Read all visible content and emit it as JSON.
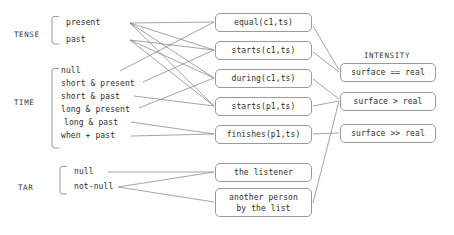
{
  "diagram": {
    "type": "feature-to-predicate mapping diagram",
    "groups": [
      {
        "name": "tense-group",
        "label": "TENSE",
        "label_x": 14,
        "label_y": 30,
        "bracket": {
          "x": 52,
          "y": 16,
          "width": 7,
          "height": 28
        },
        "items": [
          {
            "label": "present",
            "x": 66,
            "y": 18,
            "anchor_x": 128,
            "anchor_y": 23
          },
          {
            "label": "past",
            "x": 66,
            "y": 35,
            "anchor_x": 128,
            "anchor_y": 40
          }
        ]
      },
      {
        "name": "time-group",
        "label": "TIME",
        "label_x": 14,
        "label_y": 98,
        "bracket": {
          "x": 52,
          "y": 68,
          "width": 7,
          "height": 80
        },
        "items": [
          {
            "label": "null",
            "x": 61,
            "y": 66,
            "anchor_x": 120,
            "anchor_y": 71
          },
          {
            "label": "short & present",
            "x": 61,
            "y": 79,
            "anchor_x": 142,
            "anchor_y": 84
          },
          {
            "label": "short & past",
            "x": 61,
            "y": 92,
            "anchor_x": 133,
            "anchor_y": 97
          },
          {
            "label": "long & present",
            "x": 61,
            "y": 105,
            "anchor_x": 138,
            "anchor_y": 110
          },
          {
            "label": "long & past",
            "x": 64,
            "y": 118,
            "anchor_x": 130,
            "anchor_y": 123
          },
          {
            "label": "when + past",
            "x": 61,
            "y": 131,
            "anchor_x": 130,
            "anchor_y": 136
          }
        ]
      },
      {
        "name": "tar-group",
        "label": "TAR",
        "label_x": 18,
        "label_y": 183,
        "bracket": {
          "x": 60,
          "y": 166,
          "width": 7,
          "height": 28
        },
        "items": [
          {
            "label": "null",
            "x": 74,
            "y": 167,
            "anchor_x": 108,
            "anchor_y": 172
          },
          {
            "label": "not-null",
            "x": 74,
            "y": 182,
            "anchor_x": 117,
            "anchor_y": 187
          }
        ]
      }
    ],
    "predicate_nodes": [
      {
        "name": "equal-c1-ts",
        "label": "equal(c1,ts)",
        "x": 215,
        "y": 13,
        "width": 97,
        "height": 19
      },
      {
        "name": "starts-c1-ts",
        "label": "starts(c1,ts)",
        "x": 215,
        "y": 41,
        "width": 97,
        "height": 19
      },
      {
        "name": "during-c1-ts",
        "label": "during(c1,ts)",
        "x": 215,
        "y": 69,
        "width": 97,
        "height": 19
      },
      {
        "name": "starts-p1-ts",
        "label": "starts(p1,ts)",
        "x": 215,
        "y": 97,
        "width": 97,
        "height": 19
      },
      {
        "name": "finishes-p1-ts",
        "label": "finishes(p1,ts)",
        "x": 215,
        "y": 125,
        "width": 97,
        "height": 19
      }
    ],
    "target_nodes": [
      {
        "name": "the-listener",
        "label": "the listener",
        "x": 215,
        "y": 163,
        "width": 97,
        "height": 19
      },
      {
        "name": "another-person-by-the-list",
        "label": "another person\nby the list",
        "x": 215,
        "y": 188,
        "width": 97,
        "height": 29
      }
    ],
    "intensity_column": {
      "heading": "INTENSITY",
      "heading_x": 364,
      "heading_y": 51,
      "nodes": [
        {
          "name": "surface-equals-real",
          "label": "surface == real",
          "x": 340,
          "y": 63,
          "width": 96,
          "height": 19
        },
        {
          "name": "surface-greater-real",
          "label": "surface > real",
          "x": 340,
          "y": 92,
          "width": 96,
          "height": 19
        },
        {
          "name": "surface-much-greater-real",
          "label": "surface >> real",
          "x": 340,
          "y": 124,
          "width": 96,
          "height": 19
        }
      ]
    },
    "edges": [
      {
        "from": "present",
        "to": "equal-c1-ts",
        "x1": 130,
        "y1": 23,
        "x2": 214,
        "y2": 22
      },
      {
        "from": "present",
        "to": "during-c1-ts",
        "x1": 130,
        "y1": 23,
        "x2": 214,
        "y2": 78
      },
      {
        "from": "present",
        "to": "starts-p1-ts",
        "x1": 130,
        "y1": 23,
        "x2": 214,
        "y2": 106
      },
      {
        "from": "present",
        "to": "starts-c1-ts",
        "x1": 130,
        "y1": 23,
        "x2": 214,
        "y2": 50
      },
      {
        "from": "past",
        "to": "starts-c1-ts",
        "x1": 130,
        "y1": 40,
        "x2": 214,
        "y2": 50
      },
      {
        "from": "past",
        "to": "during-c1-ts",
        "x1": 130,
        "y1": 40,
        "x2": 214,
        "y2": 78
      },
      {
        "from": "past",
        "to": "starts-p1-ts",
        "x1": 130,
        "y1": 40,
        "x2": 214,
        "y2": 106
      },
      {
        "from": "null-time",
        "to": "equal-c1-ts",
        "x1": 120,
        "y1": 71,
        "x2": 214,
        "y2": 22
      },
      {
        "from": "short-and-present",
        "to": "starts-c1-ts",
        "x1": 143,
        "y1": 82,
        "x2": 214,
        "y2": 50
      },
      {
        "from": "short-and-past",
        "to": "starts-p1-ts",
        "x1": 134,
        "y1": 96,
        "x2": 214,
        "y2": 106
      },
      {
        "from": "long-and-present",
        "to": "during-c1-ts",
        "x1": 139,
        "y1": 108,
        "x2": 214,
        "y2": 78
      },
      {
        "from": "long-and-past",
        "to": "finishes-p1-ts",
        "x1": 131,
        "y1": 122,
        "x2": 214,
        "y2": 134
      },
      {
        "from": "when-plus-past",
        "to": "finishes-p1-ts",
        "x1": 131,
        "y1": 136,
        "x2": 214,
        "y2": 134
      },
      {
        "from": "null-tar",
        "to": "the-listener",
        "x1": 108,
        "y1": 172,
        "x2": 214,
        "y2": 172
      },
      {
        "from": "not-null",
        "to": "the-listener",
        "x1": 118,
        "y1": 187,
        "x2": 214,
        "y2": 172
      },
      {
        "from": "not-null",
        "to": "another-person-by-the-list",
        "x1": 118,
        "y1": 187,
        "x2": 214,
        "y2": 202
      },
      {
        "from": "equal-c1-ts",
        "to": "surface-equals-real",
        "x1": 313,
        "y1": 26,
        "x2": 339,
        "y2": 70
      },
      {
        "from": "starts-c1-ts",
        "to": "surface-equals-real",
        "x1": 313,
        "y1": 52,
        "x2": 339,
        "y2": 72
      },
      {
        "from": "during-c1-ts",
        "to": "surface-greater-real",
        "x1": 313,
        "y1": 79,
        "x2": 339,
        "y2": 99
      },
      {
        "from": "starts-p1-ts",
        "to": "surface-greater-real",
        "x1": 313,
        "y1": 106,
        "x2": 339,
        "y2": 101
      },
      {
        "from": "finishes-p1-ts",
        "to": "surface-much-greater-real",
        "x1": 313,
        "y1": 134,
        "x2": 339,
        "y2": 133
      },
      {
        "from": "another-person-by-the-list",
        "to": "surface-greater-real",
        "x1": 313,
        "y1": 203,
        "x2": 339,
        "y2": 101
      }
    ],
    "style": {
      "edge_color": "#7d7d7d",
      "box_border_color": "#9a9a9a",
      "text_color": "#2e2e2e",
      "background": "#ffffff"
    }
  }
}
